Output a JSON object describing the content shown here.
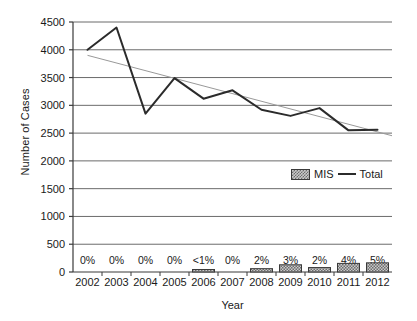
{
  "chart_data": {
    "type": "line",
    "title": "",
    "xlabel": "Year",
    "ylabel": "Number of Cases",
    "categories": [
      "2002",
      "2003",
      "2004",
      "2005",
      "2006",
      "2007",
      "2008",
      "2009",
      "2010",
      "2011",
      "2012"
    ],
    "ylim": [
      0,
      4500
    ],
    "y_ticks": [
      0,
      500,
      1000,
      1500,
      2000,
      2500,
      3000,
      3500,
      4000,
      4500
    ],
    "y_tick_labels": [
      "0",
      "500",
      "1000",
      "1500",
      "2000",
      "2500",
      "3000",
      "3500",
      "4000",
      "4500"
    ],
    "grid": true,
    "legend_position": "inside-right",
    "series": [
      {
        "name": "Total",
        "render": "line",
        "color": "#2b2b2b",
        "values": [
          4000,
          4400,
          2850,
          3490,
          3120,
          3270,
          2920,
          2810,
          2950,
          2550,
          2560
        ]
      },
      {
        "name": "MIS",
        "render": "bar",
        "color": "#c9c9c9",
        "values": [
          0,
          0,
          0,
          0,
          35,
          0,
          60,
          130,
          80,
          155,
          165
        ]
      },
      {
        "name": "Trendline",
        "render": "line",
        "color": "#999999",
        "values": [
          3900,
          3755,
          3610,
          3466,
          3321,
          3176,
          3032,
          2887,
          2742,
          2598,
          2453
        ]
      }
    ],
    "data_labels": {
      "series": "MIS",
      "values": [
        "0%",
        "0%",
        "0%",
        "0%",
        "<1%",
        "0%",
        "2%",
        "3%",
        "2%",
        "4%",
        "5%"
      ]
    },
    "legend_entries": [
      {
        "label": "MIS",
        "marker": "hatched-swatch"
      },
      {
        "label": "Total",
        "marker": "line"
      }
    ]
  }
}
